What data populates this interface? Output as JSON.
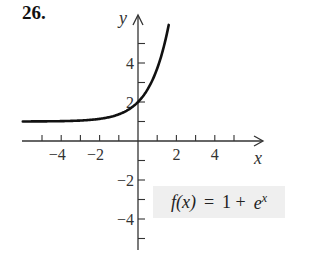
{
  "problem_number": "26.",
  "formula": {
    "lhs": "f(x)",
    "equals": "=",
    "rhs_const": "1 +",
    "rhs_base": "e",
    "rhs_exp": "x"
  },
  "chart_data": {
    "type": "line",
    "title": "",
    "function": "f(x) = 1 + e^x",
    "xlabel": "x",
    "ylabel": "y",
    "xlim": [
      -6,
      6
    ],
    "ylim": [
      -5.5,
      6.5
    ],
    "x_ticks": [
      -5,
      -4,
      -3,
      -2,
      -1,
      1,
      2,
      3,
      4,
      5
    ],
    "x_tick_labels": {
      "-4": "−4",
      "-2": "−2",
      "2": "2",
      "4": "4"
    },
    "y_ticks": [
      -5,
      -4,
      -3,
      -2,
      -1,
      1,
      2,
      3,
      4,
      5
    ],
    "y_tick_labels": {
      "-4": "−4",
      "-2": "−2",
      "2": "2",
      "4": "4"
    },
    "grid": false,
    "series": [
      {
        "name": "f(x) = 1 + e^x",
        "x": [
          -6,
          -5,
          -4,
          -3,
          -2,
          -1,
          0,
          0.5,
          1,
          1.3,
          1.6
        ],
        "y": [
          1.0,
          1.01,
          1.02,
          1.05,
          1.14,
          1.37,
          2.0,
          2.65,
          3.72,
          4.67,
          5.95
        ]
      }
    ],
    "annotations": [
      "f(x) = 1 + e^x"
    ],
    "asymptote": "y = 1"
  },
  "style": {
    "axis_color": "#333333",
    "curve_color": "#111111",
    "formula_bg": "#efefef"
  }
}
